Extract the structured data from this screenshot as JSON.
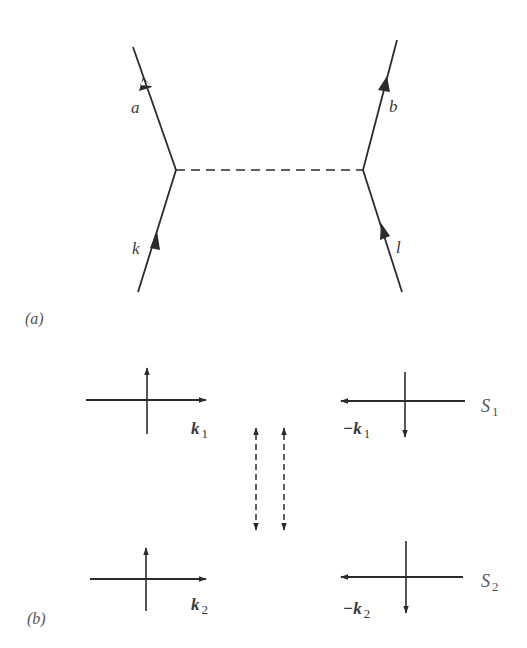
{
  "figure": {
    "panel_a": {
      "caption": "(a)",
      "lines": {
        "a": "a",
        "b": "b",
        "k": "k",
        "l": "l"
      },
      "propagator": "dashed"
    },
    "panel_b": {
      "caption": "(b)",
      "states": [
        {
          "name": "S",
          "sub": "1",
          "left_vector": "k",
          "left_sub": "1",
          "right_vector": "−k",
          "right_sub": "1"
        },
        {
          "name": "S",
          "sub": "2",
          "left_vector": "k",
          "left_sub": "2",
          "right_vector": "−k",
          "right_sub": "2"
        }
      ],
      "exchange": "dashed double-headed arrows"
    },
    "colors": {
      "stroke": "#2b2b2b",
      "text": "#3a3a3a",
      "background": "#ffffff"
    }
  }
}
